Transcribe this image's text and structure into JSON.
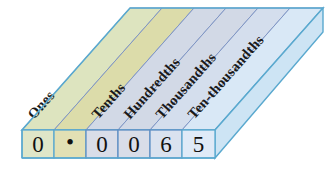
{
  "diagram": {
    "columns": [
      {
        "label": "Ones",
        "digit": "0",
        "band_color": "#dde4bf",
        "cell_color": "#dfe6c8"
      },
      {
        "label": "",
        "digit": "•",
        "band_color": "#dcdcaa",
        "cell_color": "#e2e0b4"
      },
      {
        "label": "Tenths",
        "digit": "0",
        "band_color": "#d2d9e6",
        "cell_color": "#d9dde8"
      },
      {
        "label": "Hundredths",
        "digit": "0",
        "band_color": "#d2d9e6",
        "cell_color": "#d9dde8"
      },
      {
        "label": "Thousandths",
        "digit": "6",
        "band_color": "#d4deed",
        "cell_color": "#dae2ef"
      },
      {
        "label": "Ten-thousandths",
        "digit": "5",
        "band_color": "#d9e8f6",
        "cell_color": "#dfeaf7"
      }
    ],
    "number": "0.0065",
    "colors": {
      "outline": "#5aa9cf",
      "band_divider": "#7f95c4",
      "side_face": "#cde4f4",
      "text": "#111111"
    }
  }
}
